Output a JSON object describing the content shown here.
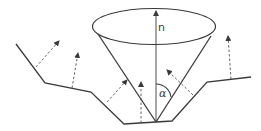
{
  "diagram": {
    "title": "",
    "labels": {
      "normal": "n",
      "angle": "α"
    },
    "colors": {
      "stroke": "#3a3a3a",
      "dashed": "#555555",
      "background": "#ffffff"
    },
    "elements": {
      "surface_profile": "polyline surface with a V-shaped pit",
      "cone": "cone of apex at pit bottom, axis along normal n",
      "normal_vector": "n",
      "half_angle": "α",
      "dashed_arrows_count": 6
    }
  }
}
